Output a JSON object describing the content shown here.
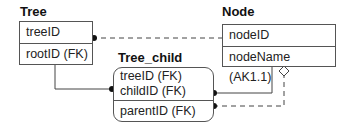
{
  "diagram": {
    "entities": [
      {
        "id": "tree",
        "name": "Tree",
        "key_attributes": [
          "treeID"
        ],
        "attributes": [
          "rootID (FK)"
        ],
        "dependent": false
      },
      {
        "id": "node",
        "name": "Node",
        "key_attributes": [
          "nodeID"
        ],
        "attributes": [
          "nodeName (AK1.1)"
        ],
        "dependent": false
      },
      {
        "id": "tree_child",
        "name": "Tree_child",
        "key_attributes": [
          "treeID (FK)",
          "childID (FK)"
        ],
        "attributes": [
          "parentID (FK)"
        ],
        "dependent": true
      }
    ],
    "relationships": [
      {
        "from": "Tree",
        "to": "Node",
        "style": "dashed",
        "end": "dot-at-Tree"
      },
      {
        "from": "Tree",
        "to": "Tree_child",
        "style": "solid",
        "end": "dot-at-Tree_child"
      },
      {
        "from": "Node",
        "to": "Tree_child",
        "style": "solid",
        "end": "dot-at-Tree_child"
      },
      {
        "from": "Node",
        "to": "Tree_child",
        "style": "dashed",
        "end": "dot-at-Tree_child",
        "start": "diamond-at-Node"
      }
    ]
  }
}
